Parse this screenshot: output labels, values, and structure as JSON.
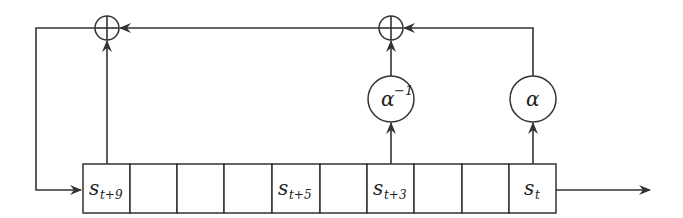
{
  "diagram": {
    "type": "linear feedback shift register",
    "register": {
      "cell_count": 10,
      "cells": [
        {
          "index": 0,
          "label": "s",
          "subscript": "t+9"
        },
        {
          "index": 1,
          "label": "",
          "subscript": ""
        },
        {
          "index": 2,
          "label": "",
          "subscript": ""
        },
        {
          "index": 3,
          "label": "",
          "subscript": ""
        },
        {
          "index": 4,
          "label": "s",
          "subscript": "t+5"
        },
        {
          "index": 5,
          "label": "",
          "subscript": ""
        },
        {
          "index": 6,
          "label": "s",
          "subscript": "t+3"
        },
        {
          "index": 7,
          "label": "",
          "subscript": ""
        },
        {
          "index": 8,
          "label": "",
          "subscript": ""
        },
        {
          "index": 9,
          "label": "s",
          "subscript": "t"
        }
      ]
    },
    "multipliers": [
      {
        "id": "mult-alpha-inverse",
        "symbol": "α",
        "superscript": "−1",
        "tap_cell": 6
      },
      {
        "id": "mult-alpha",
        "symbol": "α",
        "superscript": "",
        "tap_cell": 9
      }
    ],
    "adders": [
      {
        "id": "xor-left",
        "symbol": "⊕",
        "tap_cell": 0
      },
      {
        "id": "xor-right",
        "symbol": "⊕",
        "tap_cell": 6
      }
    ],
    "feedback": "sum fed back into s_{t+9} input on the left",
    "output": "s_t shifted out to the right"
  }
}
